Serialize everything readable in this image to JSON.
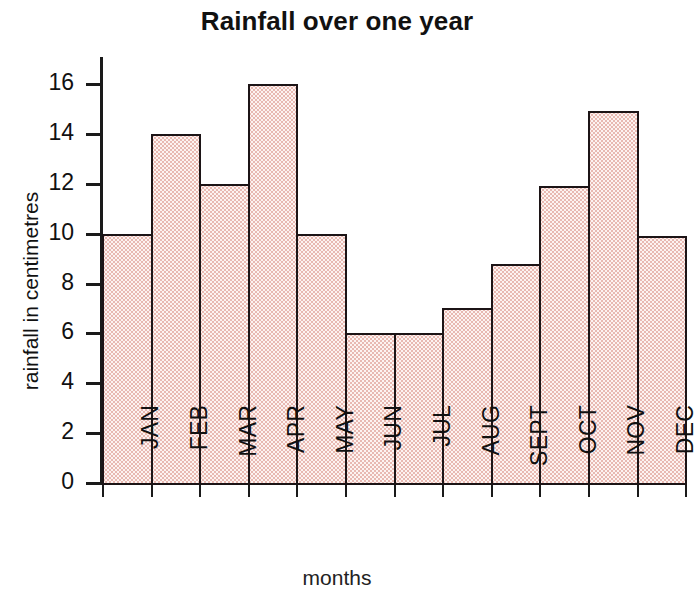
{
  "chart_data": {
    "type": "bar",
    "title": "Rainfall over one year",
    "xlabel": "months",
    "ylabel": "rainfall in centimetres",
    "categories": [
      "JAN",
      "FEB",
      "MAR",
      "APR",
      "MAY",
      "JUN",
      "JUL",
      "AUG",
      "SEPT",
      "OCT",
      "NOV",
      "DEC"
    ],
    "values": [
      10,
      14,
      12,
      16,
      10,
      6,
      6,
      7,
      8.8,
      11.9,
      14.9,
      9.9
    ],
    "ylim": [
      0,
      16
    ],
    "ytick_labels": [
      "16",
      "14",
      "12",
      "10",
      "8",
      "6",
      "4",
      "2",
      "0"
    ],
    "ytick_values": [
      16,
      14,
      12,
      10,
      8,
      6,
      4,
      2,
      0
    ],
    "grid": false,
    "legend": false,
    "bar_style": "contiguous-histogram",
    "bar_fill_color": "#fdf3f1",
    "bar_stipple_color": "#e8b9b2",
    "bar_edge_color": "#1c1416",
    "axis_color": "#1a1a1a",
    "background_color": "#ffffff"
  }
}
